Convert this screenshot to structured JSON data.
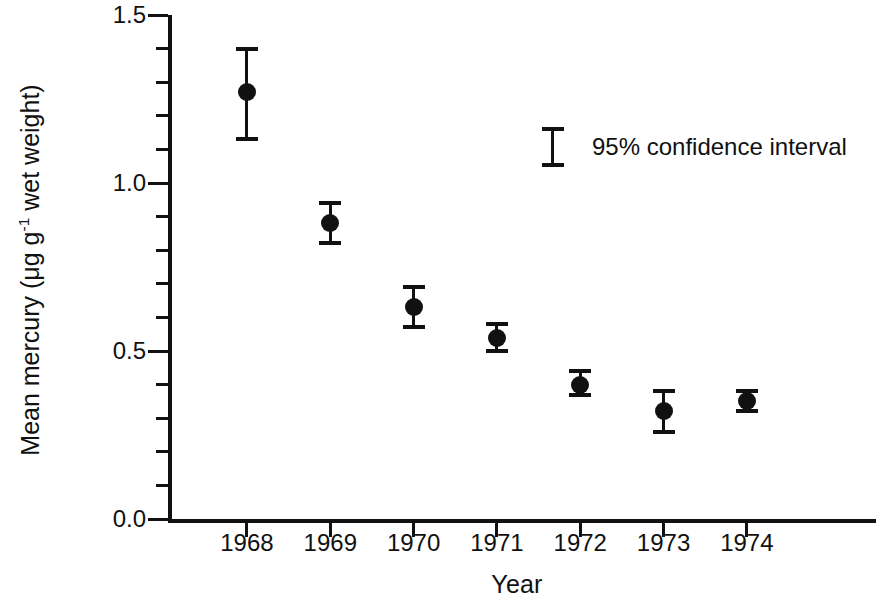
{
  "chart_data": {
    "type": "scatter",
    "title": "",
    "xlabel": "Year",
    "ylabel": "Mean mercury  (μg g⁻¹ wet weight)",
    "ylabel_parts": {
      "prefix": "Mean mercury  (μg g",
      "superscript": "-1",
      "suffix": " wet weight)"
    },
    "categories": [
      "1968",
      "1969",
      "1970",
      "1971",
      "1972",
      "1973",
      "1974"
    ],
    "x": [
      1968,
      1969,
      1970,
      1971,
      1972,
      1973,
      1974
    ],
    "values": [
      1.27,
      0.88,
      0.63,
      0.54,
      0.4,
      0.32,
      0.35
    ],
    "error_upper": [
      1.4,
      0.94,
      0.69,
      0.58,
      0.44,
      0.38,
      0.38
    ],
    "error_lower": [
      1.13,
      0.82,
      0.57,
      0.5,
      0.37,
      0.26,
      0.32
    ],
    "error_type": "95% confidence interval",
    "ylim": [
      0.0,
      1.5
    ],
    "xlim": [
      1967.1,
      1975.55
    ],
    "ytick_major": [
      0.0,
      0.5,
      1.0,
      1.5
    ],
    "ytick_major_labels": [
      "0.0",
      "0.5",
      "1.0",
      "1.5"
    ],
    "ytick_minor": [
      0.1,
      0.2,
      0.3,
      0.4,
      0.6,
      0.7,
      0.8,
      0.9,
      1.1,
      1.2,
      1.3,
      1.4
    ],
    "xtick_values": [
      1968,
      1969,
      1970,
      1971,
      1972,
      1973,
      1974
    ],
    "grid": false,
    "legend": {
      "position": "inside-upper-right",
      "entries": [
        {
          "label": "95% confidence interval",
          "symbol": "error-bar-i"
        }
      ]
    },
    "marker": {
      "shape": "circle",
      "color": "#111111",
      "size": 18
    },
    "colors": {
      "axis": "#111111",
      "data": "#111111",
      "background": "#ffffff"
    }
  },
  "legend": {
    "confidence_label": "95% confidence interval"
  },
  "axes": {
    "x_title": "Year",
    "y_title_prefix": "Mean mercury  (μg g",
    "y_title_sup": "-1",
    "y_title_suffix": " wet weight)"
  }
}
